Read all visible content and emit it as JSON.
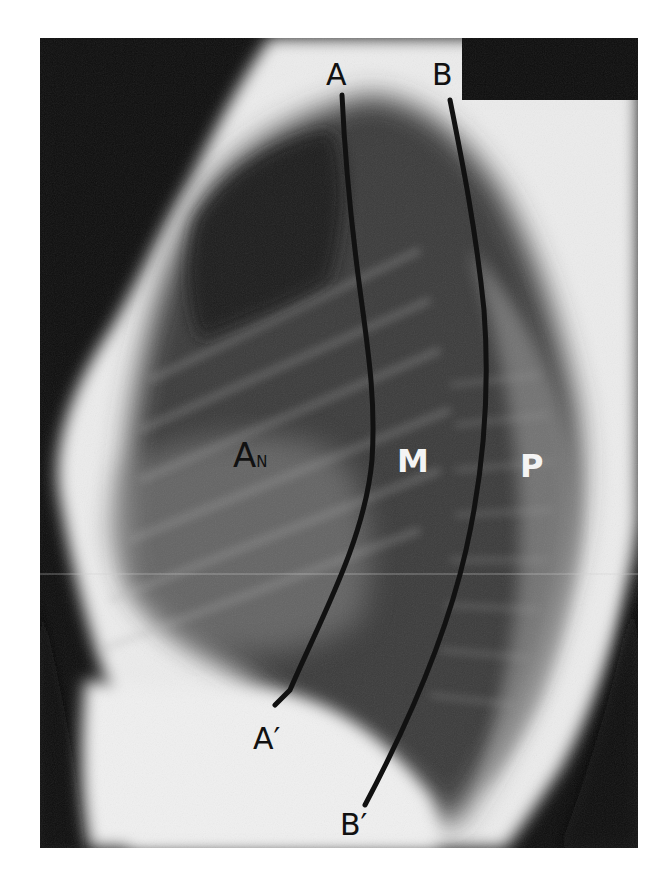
{
  "figure": {
    "colors": {
      "background": "#ffffff",
      "film_dark": "#0c0c0c",
      "soft_tissue": "#e9e9e9",
      "lung": "#3a3a3a",
      "line": "#111111",
      "label_dark": "#111111",
      "label_light": "#f4f4f4"
    },
    "labels": {
      "line_a_top": "A",
      "line_b_top": "B",
      "line_a_bottom": "A′",
      "line_b_bottom": "B′",
      "anterior": "A",
      "anterior_sub": "N",
      "middle": "M",
      "posterior": "P"
    }
  }
}
